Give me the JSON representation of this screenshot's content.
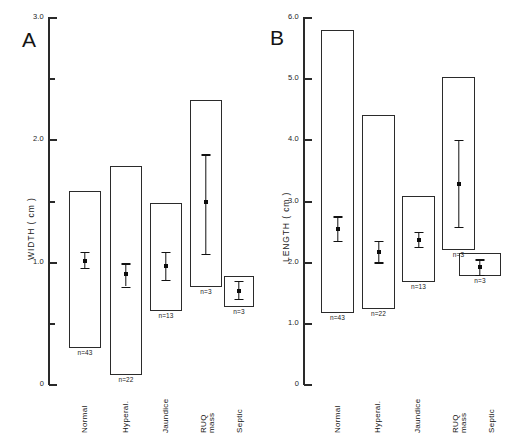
{
  "figure": {
    "panels": [
      {
        "letter": "A",
        "axis_title": "WIDTH ( cm )",
        "units": "cm",
        "categories": [
          "Normal",
          "Hyperal.",
          "Jaundice",
          "RUQ mass",
          "Septic"
        ],
        "n_labels": [
          "n=43",
          "n=22",
          "n=13",
          "n=3",
          "n=3"
        ],
        "tick_labels": [
          "3.0",
          "2.0",
          "1.0",
          "0"
        ]
      },
      {
        "letter": "B",
        "axis_title": "LENGTH ( cm )",
        "units": "cm",
        "categories": [
          "Normal",
          "Hyperal.",
          "Jaundice",
          "RUQ mass",
          "Septic"
        ],
        "n_labels": [
          "n=43",
          "n=22",
          "n=13",
          "n=3",
          "n=3"
        ],
        "tick_labels": [
          "6.0",
          "5.0",
          "4.0",
          "3.0",
          "2.0",
          "1.0",
          "0"
        ]
      }
    ]
  },
  "chart_data": [
    {
      "type": "bar",
      "title": "A",
      "xlabel": "",
      "ylabel": "WIDTH ( cm )",
      "ylim": [
        0,
        3.0
      ],
      "yticks": [
        0,
        0.5,
        1.0,
        1.5,
        2.0,
        2.5,
        3.0
      ],
      "ytick_labels": [
        "0",
        "",
        "1.0",
        "",
        "2.0",
        "",
        "3.0"
      ],
      "grid": false,
      "legend": "none",
      "categories": [
        "Normal",
        "Hyperal.",
        "Jaundice",
        "RUQ mass",
        "Septic"
      ],
      "n": [
        43,
        22,
        13,
        3,
        3
      ],
      "range_low": [
        0.3,
        0.08,
        0.6,
        0.8,
        0.63
      ],
      "range_high": [
        1.58,
        1.78,
        1.48,
        2.32,
        0.88
      ],
      "mean": [
        0.85,
        0.73,
        0.96,
        1.48,
        0.77
      ],
      "err_low": [
        0.79,
        0.64,
        0.85,
        1.07,
        0.7
      ],
      "err_high": [
        0.92,
        0.83,
        1.08,
        1.88,
        0.85
      ]
    },
    {
      "type": "bar",
      "title": "B",
      "xlabel": "",
      "ylabel": "LENGTH ( cm )",
      "ylim": [
        0,
        6.0
      ],
      "yticks": [
        0,
        1.0,
        2.0,
        3.0,
        4.0,
        5.0,
        6.0
      ],
      "ytick_labels": [
        "0",
        "1.0",
        "2.0",
        "3.0",
        "4.0",
        "5.0",
        "6.0"
      ],
      "grid": false,
      "legend": "none",
      "categories": [
        "Normal",
        "Hyperal.",
        "Jaundice",
        "RUQ mass",
        "Septic"
      ],
      "n": [
        43,
        22,
        13,
        3,
        3
      ],
      "range_low": [
        1.18,
        1.25,
        1.68,
        2.2,
        1.78
      ],
      "range_high": [
        5.78,
        4.4,
        3.08,
        5.02,
        2.15
      ],
      "mean": [
        2.55,
        2.17,
        2.37,
        3.28,
        1.92
      ],
      "err_low": [
        2.35,
        2.0,
        2.25,
        2.58,
        1.8
      ],
      "err_high": [
        2.75,
        2.35,
        2.5,
        4.0,
        2.05
      ]
    }
  ]
}
